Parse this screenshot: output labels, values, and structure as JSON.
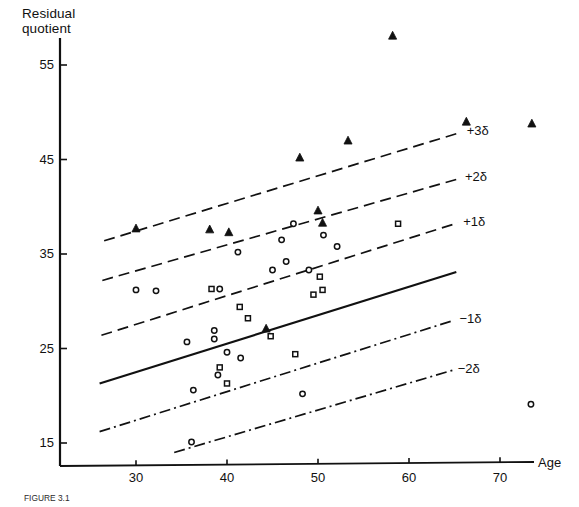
{
  "figure": {
    "y_axis_title": "Residual\nquotient",
    "x_axis_title": "Age",
    "caption": "FIGURE 3.1"
  },
  "chart_data": {
    "type": "scatter",
    "title": "",
    "xlabel": "Age",
    "ylabel": "Residual quotient",
    "xlim": [
      22,
      76
    ],
    "ylim": [
      13.5,
      59
    ],
    "grid": false,
    "legend_position": "none",
    "xticks": [
      30,
      40,
      50,
      60,
      70
    ],
    "yticks": [
      15,
      25,
      35,
      45,
      55
    ],
    "xtick_labels": [
      "30",
      "40",
      "50",
      "60",
      "70"
    ],
    "ytick_labels": [
      "15",
      "25",
      "35",
      "45",
      "55"
    ],
    "series": [
      {
        "name": "filled-triangle",
        "marker": "triangle-filled",
        "points": [
          {
            "x": 30.0,
            "y": 37.7
          },
          {
            "x": 38.1,
            "y": 37.6
          },
          {
            "x": 40.2,
            "y": 37.3
          },
          {
            "x": 44.3,
            "y": 27.1
          },
          {
            "x": 48.0,
            "y": 45.2
          },
          {
            "x": 50.0,
            "y": 39.6
          },
          {
            "x": 50.5,
            "y": 38.3
          },
          {
            "x": 53.3,
            "y": 47.0
          },
          {
            "x": 58.2,
            "y": 58.1
          },
          {
            "x": 66.3,
            "y": 49.0
          },
          {
            "x": 73.5,
            "y": 48.8
          }
        ]
      },
      {
        "name": "open-circle",
        "marker": "circle-open",
        "points": [
          {
            "x": 30.0,
            "y": 31.2
          },
          {
            "x": 32.2,
            "y": 31.1
          },
          {
            "x": 35.6,
            "y": 25.7
          },
          {
            "x": 36.1,
            "y": 15.1
          },
          {
            "x": 36.3,
            "y": 20.6
          },
          {
            "x": 38.6,
            "y": 26.9
          },
          {
            "x": 38.6,
            "y": 26.0
          },
          {
            "x": 39.0,
            "y": 22.2
          },
          {
            "x": 39.2,
            "y": 31.3
          },
          {
            "x": 40.0,
            "y": 24.6
          },
          {
            "x": 41.2,
            "y": 35.2
          },
          {
            "x": 41.5,
            "y": 24.0
          },
          {
            "x": 45.0,
            "y": 33.3
          },
          {
            "x": 46.0,
            "y": 36.5
          },
          {
            "x": 46.5,
            "y": 34.2
          },
          {
            "x": 47.3,
            "y": 38.2
          },
          {
            "x": 48.3,
            "y": 20.2
          },
          {
            "x": 49.0,
            "y": 33.3
          },
          {
            "x": 50.6,
            "y": 37.0
          },
          {
            "x": 52.1,
            "y": 35.8
          },
          {
            "x": 73.4,
            "y": 19.1
          }
        ]
      },
      {
        "name": "open-square",
        "marker": "square-open",
        "points": [
          {
            "x": 38.3,
            "y": 31.3
          },
          {
            "x": 39.2,
            "y": 23.0
          },
          {
            "x": 40.0,
            "y": 21.3
          },
          {
            "x": 41.4,
            "y": 29.4
          },
          {
            "x": 42.3,
            "y": 28.2
          },
          {
            "x": 44.8,
            "y": 26.3
          },
          {
            "x": 47.5,
            "y": 24.4
          },
          {
            "x": 49.5,
            "y": 30.7
          },
          {
            "x": 50.2,
            "y": 32.6
          },
          {
            "x": 50.5,
            "y": 31.2
          },
          {
            "x": 58.8,
            "y": 38.2
          }
        ]
      }
    ],
    "reference_lines": [
      {
        "label": "+3δ",
        "style": "dashed",
        "x0": 26.5,
        "y0": 36.4,
        "x1": 65.8,
        "y1": 47.9
      },
      {
        "label": "+2δ",
        "style": "dashed",
        "x0": 26.3,
        "y0": 32.2,
        "x1": 65.6,
        "y1": 43.0
      },
      {
        "label": "+1δ",
        "style": "dashed",
        "x0": 26.2,
        "y0": 26.4,
        "x1": 65.4,
        "y1": 38.3
      },
      {
        "label": "",
        "style": "solid",
        "x0": 26.0,
        "y0": 21.3,
        "x1": 65.2,
        "y1": 33.1
      },
      {
        "label": "−1δ",
        "style": "dashdot",
        "x0": 26.0,
        "y0": 16.2,
        "x1": 65.0,
        "y1": 28.0
      },
      {
        "label": "−2δ",
        "style": "dashdot",
        "x0": 34.2,
        "y0": 14.0,
        "x1": 64.8,
        "y1": 22.7
      }
    ]
  }
}
